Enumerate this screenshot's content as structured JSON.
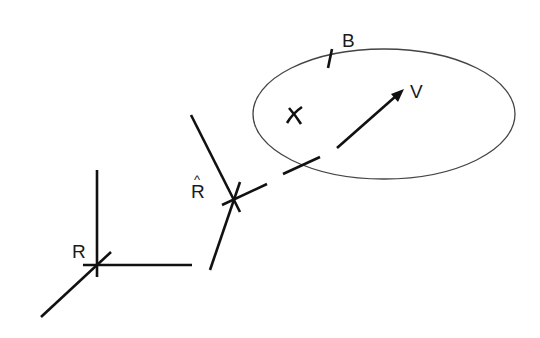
{
  "diagram": {
    "type": "frame-and-body-diagram",
    "labels": {
      "R": "R",
      "R_hat": "R",
      "R_hat_accent": "^",
      "B": "B",
      "V": "V"
    },
    "elements": [
      {
        "id": "frame-R",
        "description": "Reference frame R with three axes"
      },
      {
        "id": "frame-R-hat",
        "description": "Estimated frame R-hat with three axes"
      },
      {
        "id": "body-B",
        "description": "Ellipse representing body B with boundary tick mark"
      },
      {
        "id": "center-mark",
        "description": "Curved cross mark inside body B"
      },
      {
        "id": "line-of-sight",
        "description": "Dashed line from R-hat toward body B ending in arrow V"
      },
      {
        "id": "vector-V",
        "description": "Arrow labelled V inside body B"
      }
    ],
    "colors": {
      "stroke": "#111111",
      "ellipse": "#444444",
      "background": "#ffffff"
    }
  }
}
